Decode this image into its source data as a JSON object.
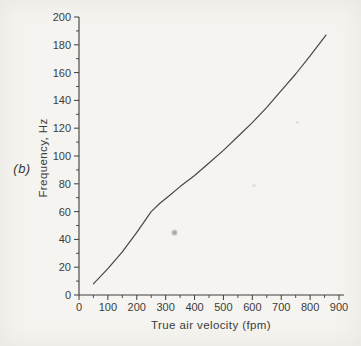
{
  "panel_label": "(b)",
  "colors": {
    "paper": "#f5f4f0",
    "ink": "#3c3c3c",
    "curve": "#474747"
  },
  "chart_data": {
    "type": "line",
    "title": "",
    "xlabel": "True air velocity (fpm)",
    "ylabel": "Frequency, Hz",
    "panel": "(b)",
    "xlim": [
      0,
      900
    ],
    "ylim": [
      0,
      200
    ],
    "grid": false,
    "legend_position": "none",
    "x_major_ticks": [
      0,
      100,
      200,
      300,
      400,
      500,
      600,
      700,
      800,
      900
    ],
    "x_minor_ticks": [
      50,
      150,
      250,
      350,
      450,
      550,
      650,
      750,
      850
    ],
    "y_major_ticks": [
      0,
      20,
      40,
      60,
      80,
      100,
      120,
      140,
      160,
      180,
      200
    ],
    "y_minor_ticks": [
      10,
      30,
      50,
      70,
      90,
      110,
      130,
      150,
      170,
      190
    ],
    "series": [
      {
        "name": "frequency-vs-true-air-velocity",
        "points": [
          [
            50,
            8
          ],
          [
            100,
            19
          ],
          [
            150,
            31
          ],
          [
            200,
            45
          ],
          [
            250,
            60
          ],
          [
            280,
            66
          ],
          [
            310,
            71
          ],
          [
            350,
            78
          ],
          [
            400,
            86
          ],
          [
            450,
            95
          ],
          [
            500,
            104
          ],
          [
            550,
            114
          ],
          [
            600,
            124
          ],
          [
            650,
            135
          ],
          [
            700,
            147
          ],
          [
            750,
            159
          ],
          [
            800,
            172
          ],
          [
            855,
            187
          ]
        ]
      }
    ]
  }
}
